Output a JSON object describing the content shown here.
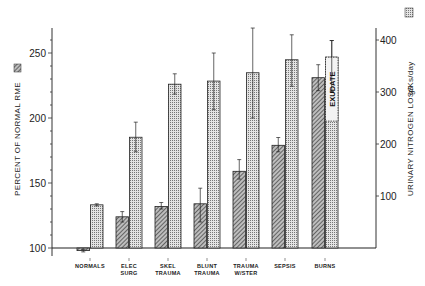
{
  "chart_data": {
    "type": "bar",
    "title": "",
    "categories": [
      "NORMALS",
      "ELEC SURG",
      "SKEL TRAUMA",
      "BLUNT TRAUMA",
      "TRAUMA W/STER",
      "SEPSIS",
      "BURNS"
    ],
    "category_lines": [
      [
        "NORMALS"
      ],
      [
        "ELEC",
        "SURG"
      ],
      [
        "SKEL",
        "TRAUMA"
      ],
      [
        "BLUNT",
        "TRAUMA"
      ],
      [
        "TRAUMA",
        "W/STER"
      ],
      [
        "SEPSIS"
      ],
      [
        "BURNS"
      ]
    ],
    "series": [
      {
        "name": "PERCENT OF NORMAL RME",
        "axis": "left",
        "pattern": "hatched",
        "values": [
          98,
          124,
          132,
          134,
          159,
          179,
          231
        ],
        "error_low": [
          97,
          120,
          130,
          120,
          153,
          174,
          221
        ],
        "error_high": [
          99,
          128,
          135,
          146,
          168,
          185,
          241
        ]
      },
      {
        "name": "URINARY NITROGEN LOSS g/Ks/day",
        "axis": "right",
        "pattern": "dotted",
        "values": [
          83,
          213,
          315,
          321,
          337,
          362,
          367
        ],
        "error_low": [
          81,
          185,
          296,
          266,
          250,
          311,
          301
        ],
        "error_high": [
          85,
          242,
          335,
          375,
          423,
          410,
          399
        ]
      }
    ],
    "annotations": [
      {
        "text": "EXUDATE",
        "category": "BURNS",
        "series": "URINARY NITROGEN LOSS g/Ks/day",
        "from": 244,
        "to": 367
      }
    ],
    "ylabel_left": "PERCENT OF NORMAL RME",
    "ylabel_right": "URINARY NITROGEN LOSS g/Ks/day",
    "ylim_left": [
      100,
      270
    ],
    "ylim_right": [
      0,
      420
    ],
    "yticks_left": [
      100,
      150,
      200,
      250
    ],
    "yticks_right": [
      100,
      200,
      300,
      400
    ],
    "grid": false,
    "legend": "swatches beside axis labels"
  },
  "labels": {
    "left_axis": "PERCENT OF NORMAL RME",
    "right_axis_main": "URINARY NITROGEN LOSS",
    "right_axis_unit": "g/Ks/day",
    "exudate": "EXUDATE"
  }
}
